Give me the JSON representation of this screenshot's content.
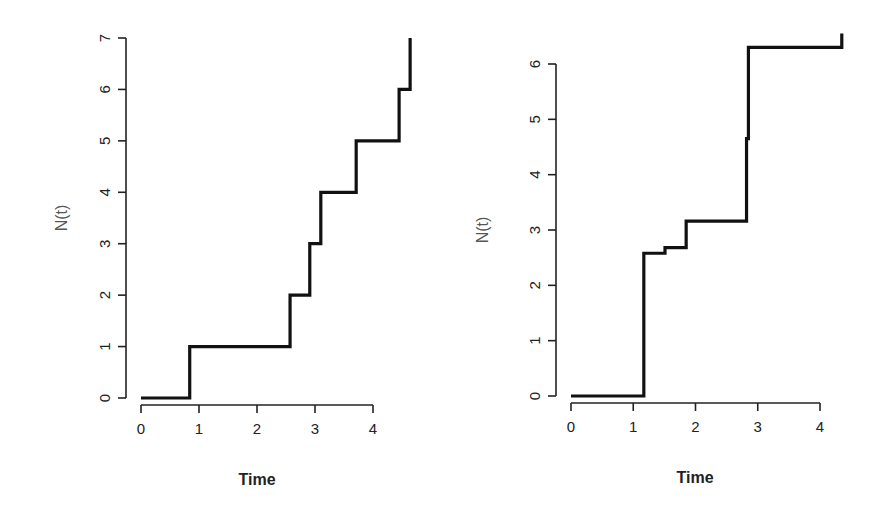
{
  "chart_data": [
    {
      "type": "line",
      "subtype": "step",
      "title": "",
      "xlabel": "Time",
      "ylabel": "N(t)",
      "xlim": [
        0,
        4.6
      ],
      "ylim": [
        0,
        7
      ],
      "x_ticks": [
        0,
        1,
        2,
        3,
        4
      ],
      "y_ticks": [
        0,
        1,
        2,
        3,
        4,
        5,
        6,
        7
      ],
      "grid": false,
      "legend": null,
      "series": [
        {
          "name": "N(t)",
          "color": "#111111",
          "x": [
            0,
            0.84,
            2.57,
            2.91,
            3.1,
            3.71,
            4.45,
            4.64
          ],
          "y": [
            0,
            1,
            2,
            3,
            4,
            5,
            6,
            7
          ]
        }
      ],
      "plot_area": {
        "x0_px": 141,
        "x4_px": 373,
        "y0_px": 398,
        "ytop_px": 38
      }
    },
    {
      "type": "line",
      "subtype": "step",
      "title": "",
      "xlabel": "Time",
      "ylabel": "N(t)",
      "xlim": [
        0,
        4.35
      ],
      "ylim": [
        0,
        6.5
      ],
      "x_ticks": [
        0,
        1,
        2,
        3,
        4
      ],
      "y_ticks": [
        0,
        1,
        2,
        3,
        4,
        5,
        6
      ],
      "grid": false,
      "legend": null,
      "series": [
        {
          "name": "N(t)",
          "color": "#111111",
          "x": [
            0,
            1.17,
            1.51,
            1.85,
            2.82,
            2.85,
            4.35
          ],
          "y": [
            0,
            2.58,
            2.68,
            3.16,
            4.65,
            6.3,
            6.55
          ]
        }
      ],
      "plot_area": {
        "x0_px": 571,
        "x4_px": 820,
        "y0_px": 396,
        "ytop_px": 64
      }
    }
  ],
  "panels": {
    "left": {
      "xlabel": "Time",
      "ylabel": "N(t)"
    },
    "right": {
      "xlabel": "Time",
      "ylabel": "N(t)"
    }
  }
}
